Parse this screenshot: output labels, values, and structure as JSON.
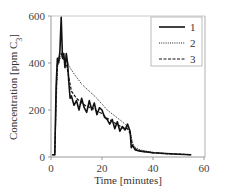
{
  "chart_data": {
    "type": "line",
    "title": "",
    "xlabel": "Time [minutes]",
    "ylabel": "Concentration [ppm C3]",
    "ylabel_main": "Concentration [ppm C",
    "ylabel_sub": "3",
    "ylabel_close": "]",
    "xlim": [
      0,
      60
    ],
    "ylim": [
      0,
      600
    ],
    "xticks": [
      0,
      20,
      40,
      60
    ],
    "yticks": [
      0,
      200,
      400,
      600
    ],
    "grid": false,
    "legend_position": "upper right (inside)",
    "series": [
      {
        "name": "1",
        "style": "solid",
        "color": "#111111",
        "x": [
          0.5,
          1.5,
          2.0,
          2.5,
          3.0,
          3.5,
          4.0,
          4.5,
          5.0,
          5.5,
          6.0,
          6.5,
          7.0,
          7.5,
          8.0,
          9.0,
          10.0,
          11.0,
          12.0,
          13.0,
          14.0,
          15.0,
          16.0,
          17.0,
          18.0,
          19.0,
          20.0,
          21.0,
          22.0,
          23.0,
          24.0,
          25.0,
          26.0,
          27.0,
          28.0,
          29.0,
          30.0,
          31.0,
          31.5,
          32.0,
          33.0,
          35.0,
          40.0,
          45.0,
          50.0,
          55.0
        ],
        "y": [
          10,
          10,
          300,
          420,
          400,
          450,
          595,
          420,
          440,
          380,
          440,
          400,
          320,
          250,
          260,
          220,
          240,
          200,
          250,
          210,
          190,
          240,
          200,
          230,
          180,
          210,
          200,
          170,
          160,
          140,
          160,
          120,
          150,
          110,
          130,
          115,
          140,
          110,
          40,
          50,
          30,
          25,
          18,
          15,
          12,
          10
        ]
      },
      {
        "name": "2",
        "style": "dotted",
        "color": "#222222",
        "x": [
          0.5,
          1.5,
          2.0,
          2.5,
          3.0,
          4.0,
          5.0,
          6.0,
          7.0,
          8.0,
          10.0,
          12.0,
          15.0,
          18.0,
          20.0,
          22.0,
          25.0,
          28.0,
          30.0,
          31.0,
          32.0,
          33.0,
          35.0,
          40.0,
          45.0,
          50.0,
          55.0
        ],
        "y": [
          10,
          10,
          200,
          380,
          400,
          430,
          420,
          410,
          390,
          370,
          340,
          310,
          280,
          250,
          225,
          200,
          175,
          150,
          130,
          110,
          60,
          40,
          30,
          20,
          15,
          12,
          10
        ]
      },
      {
        "name": "3",
        "style": "dashed",
        "color": "#111111",
        "x": [
          0.5,
          1.5,
          2.0,
          2.5,
          3.0,
          4.0,
          5.0,
          6.0,
          7.0,
          8.0,
          10.0,
          12.0,
          14.0,
          16.0,
          18.0,
          20.0,
          22.0,
          25.0,
          28.0,
          30.0,
          31.0,
          32.0,
          33.0,
          35.0,
          40.0,
          45.0,
          50.0,
          55.0
        ],
        "y": [
          10,
          10,
          250,
          400,
          420,
          440,
          410,
          400,
          340,
          280,
          250,
          230,
          215,
          210,
          195,
          185,
          165,
          145,
          125,
          120,
          100,
          45,
          35,
          25,
          18,
          14,
          12,
          10
        ]
      }
    ]
  },
  "legend": {
    "items": [
      {
        "label": "1",
        "style": "solid"
      },
      {
        "label": "2",
        "style": "dotted"
      },
      {
        "label": "3",
        "style": "dashed"
      }
    ]
  },
  "axes": {
    "x_tick_labels": [
      "0",
      "20",
      "40",
      "60"
    ],
    "y_tick_labels": [
      "0",
      "200",
      "400",
      "600"
    ]
  },
  "colors": {
    "axis": "#999999",
    "frame": "#aaaaaa",
    "line": "#111111"
  }
}
